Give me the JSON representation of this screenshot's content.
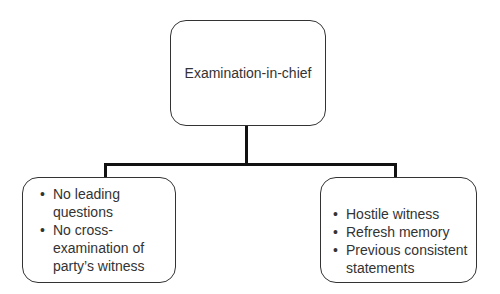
{
  "diagram": {
    "root": {
      "label": "Examination-in-chief"
    },
    "children": [
      {
        "items": [
          "No leading questions",
          "No cross-examination of party’s witness"
        ]
      },
      {
        "items": [
          "Hostile witness",
          "Refresh memory",
          "Previous consistent statements"
        ]
      }
    ],
    "colors": {
      "line": "#111111",
      "border": "#333333",
      "text": "#333333"
    }
  }
}
